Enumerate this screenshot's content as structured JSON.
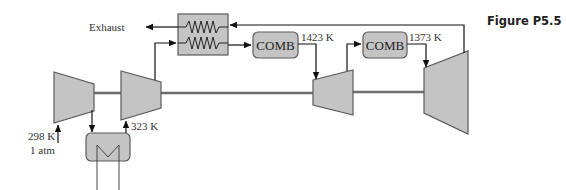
{
  "figure": {
    "caption": "Figure P5.5"
  },
  "labels": {
    "exhaust": "Exhaust",
    "inlet_temp": "298 K",
    "inlet_pressure": "1 atm",
    "intercooler_exit_temp": "323 K",
    "comb1_exit_temp": "1423 K",
    "comb2_exit_temp": "1373 K"
  },
  "components": {
    "comb1": {
      "label": "COMB"
    },
    "comb2": {
      "label": "COMB"
    },
    "compressor_lp": {
      "type": "compressor"
    },
    "compressor_hp": {
      "type": "compressor"
    },
    "turbine_hp": {
      "type": "turbine"
    },
    "turbine_lp": {
      "type": "turbine"
    },
    "regenerator": {
      "type": "heat-exchanger"
    },
    "intercooler": {
      "type": "heat-exchanger"
    }
  },
  "colors": {
    "component_fill": "#c4c4c4",
    "component_stroke": "#5a5a5a",
    "shaft": "#6e6e6e",
    "line": "#1a1a1a"
  }
}
